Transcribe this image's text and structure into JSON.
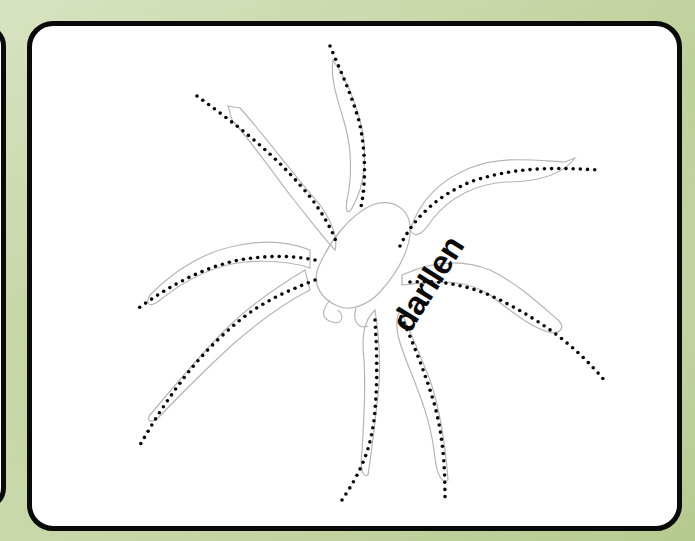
{
  "worksheet": {
    "activity": "trace-the-dotted-lines",
    "subject": "spider",
    "word": "darllen"
  },
  "colors": {
    "background": "#c2d39f",
    "card_fill": "#ffffff",
    "card_border": "#0a0a0a",
    "outline_stroke": "#b5b5b5",
    "dots": "#0a0a0a"
  }
}
